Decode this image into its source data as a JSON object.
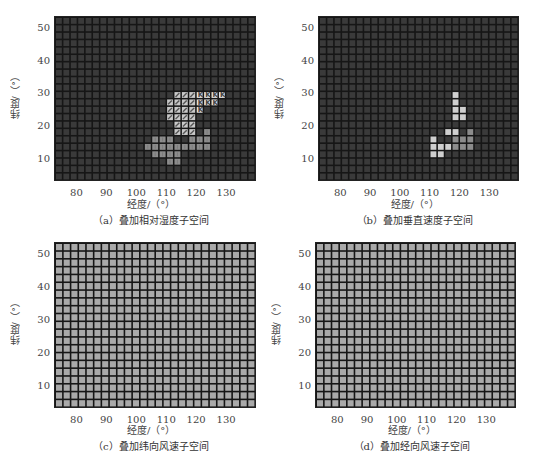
{
  "figure": {
    "xlabel": "经度/（°）",
    "ylabel": "纬度/（°）",
    "xticks": [
      "80",
      "90",
      "100",
      "110",
      "120",
      "130"
    ],
    "yticks": [
      "50",
      "40",
      "30",
      "20",
      "10"
    ],
    "colors": {
      "dark_cell": "#3a3a3a",
      "grid_line": "#161616",
      "light_cell": "#a9a9a9",
      "hatched_cell": "#c8c8c8",
      "bright_cell": "#cfcfcf"
    }
  },
  "chart_data": [
    {
      "type": "heatmap",
      "title": "（a）叠加相对湿度子空间",
      "xlabel": "经度/（°）",
      "ylabel": "纬度/（°）",
      "xlim": [
        72.5,
        140
      ],
      "ylim": [
        3.5,
        54
      ],
      "grid": {
        "cols": 27,
        "rows": 22
      },
      "background": "dark",
      "highlighted_cells": {
        "hatched": [
          [
            10,
            16
          ],
          [
            10,
            17
          ],
          [
            10,
            18
          ],
          [
            11,
            15
          ],
          [
            11,
            16
          ],
          [
            11,
            17
          ],
          [
            11,
            18
          ],
          [
            12,
            15
          ],
          [
            12,
            16
          ],
          [
            12,
            17
          ],
          [
            12,
            18
          ],
          [
            13,
            15
          ],
          [
            13,
            16
          ],
          [
            13,
            17
          ],
          [
            13,
            18
          ],
          [
            14,
            16
          ],
          [
            14,
            17
          ],
          [
            14,
            18
          ],
          [
            15,
            16
          ],
          [
            15,
            17
          ],
          [
            15,
            18
          ]
        ],
        "k_marked": [
          [
            10,
            19
          ],
          [
            10,
            20
          ],
          [
            10,
            21
          ],
          [
            10,
            22
          ],
          [
            11,
            19
          ],
          [
            11,
            20
          ],
          [
            11,
            21
          ],
          [
            12,
            19
          ]
        ],
        "light": [
          [
            15,
            20
          ],
          [
            16,
            13
          ],
          [
            16,
            14
          ],
          [
            16,
            15
          ],
          [
            16,
            18
          ],
          [
            16,
            19
          ],
          [
            16,
            20
          ],
          [
            17,
            12
          ],
          [
            17,
            13
          ],
          [
            17,
            14
          ],
          [
            17,
            15
          ],
          [
            17,
            16
          ],
          [
            17,
            17
          ],
          [
            17,
            18
          ],
          [
            17,
            19
          ],
          [
            17,
            20
          ],
          [
            18,
            13
          ],
          [
            18,
            14
          ],
          [
            18,
            15
          ],
          [
            18,
            16
          ],
          [
            19,
            15
          ],
          [
            19,
            16
          ]
        ]
      }
    },
    {
      "type": "heatmap",
      "title": "（b）叠加垂直速度子空间",
      "xlabel": "经度/（°）",
      "ylabel": "纬度/（°）",
      "xlim": [
        72.5,
        140
      ],
      "ylim": [
        3.5,
        54
      ],
      "grid": {
        "cols": 27,
        "rows": 22
      },
      "background": "dark",
      "highlighted_cells": {
        "bright": [
          [
            10,
            18
          ],
          [
            11,
            18
          ],
          [
            12,
            18
          ],
          [
            12,
            19
          ],
          [
            13,
            18
          ],
          [
            13,
            19
          ],
          [
            15,
            17
          ],
          [
            15,
            18
          ],
          [
            16,
            15
          ],
          [
            17,
            15
          ],
          [
            17,
            16
          ],
          [
            17,
            17
          ],
          [
            18,
            15
          ],
          [
            18,
            16
          ]
        ],
        "light": [
          [
            15,
            20
          ],
          [
            16,
            18
          ],
          [
            16,
            19
          ],
          [
            16,
            20
          ],
          [
            17,
            18
          ],
          [
            17,
            19
          ],
          [
            17,
            20
          ]
        ]
      }
    },
    {
      "type": "heatmap",
      "title": "（c）叠加纬向风速子空间",
      "xlabel": "经度/（°）",
      "ylabel": "纬度/（°）",
      "xlim": [
        72.5,
        140
      ],
      "ylim": [
        3.5,
        54
      ],
      "grid": {
        "cols": 26,
        "rows": 21
      },
      "background": "light",
      "highlighted_cells": "all"
    },
    {
      "type": "heatmap",
      "title": "（d）叠加经向风速子空间",
      "xlabel": "经度/（°）",
      "ylabel": "纬度/（°）",
      "xlim": [
        72.5,
        140
      ],
      "ylim": [
        3.5,
        54
      ],
      "grid": {
        "cols": 26,
        "rows": 21
      },
      "background": "light",
      "highlighted_cells": "all"
    }
  ]
}
